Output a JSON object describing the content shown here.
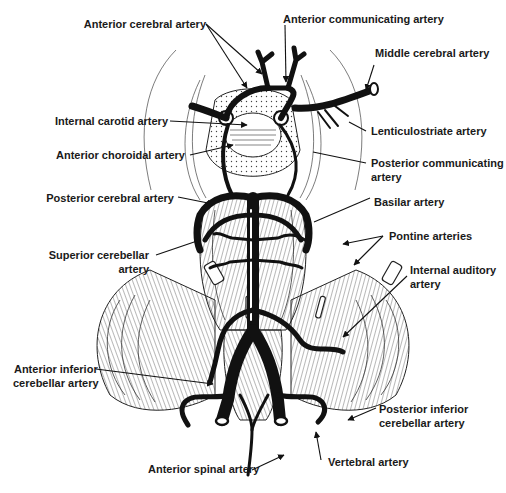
{
  "figure": {
    "colors": {
      "ink": "#111111",
      "background": "#ffffff",
      "label": "#1a1a1a"
    }
  },
  "labels": {
    "anterior_cerebral": {
      "lines": [
        "Anterior cerebral artery"
      ]
    },
    "anterior_communicating": {
      "lines": [
        "Anterior communicating artery"
      ]
    },
    "middle_cerebral": {
      "lines": [
        "Middle cerebral artery"
      ]
    },
    "internal_carotid": {
      "lines": [
        "Internal carotid artery"
      ]
    },
    "lenticulostriate": {
      "lines": [
        "Lenticulostriate artery"
      ]
    },
    "anterior_choroidal": {
      "lines": [
        "Anterior choroidal artery"
      ]
    },
    "posterior_communicating": {
      "lines": [
        "Posterior communicating",
        "artery"
      ]
    },
    "posterior_cerebral": {
      "lines": [
        "Posterior cerebral artery"
      ]
    },
    "basilar": {
      "lines": [
        "Basilar artery"
      ]
    },
    "pontine": {
      "lines": [
        "Pontine arteries"
      ]
    },
    "superior_cerebellar": {
      "lines": [
        "Superior cerebellar",
        "artery"
      ]
    },
    "internal_auditory": {
      "lines": [
        "Internal auditory",
        "artery"
      ]
    },
    "anterior_inferior_cerebellar": {
      "lines": [
        "Anterior inferior",
        "cerebellar artery"
      ]
    },
    "posterior_inferior_cerebellar": {
      "lines": [
        "Posterior inferior",
        "cerebellar artery"
      ]
    },
    "anterior_spinal": {
      "lines": [
        "Anterior spinal artery"
      ]
    },
    "vertebral": {
      "lines": [
        "Vertebral artery"
      ]
    }
  }
}
